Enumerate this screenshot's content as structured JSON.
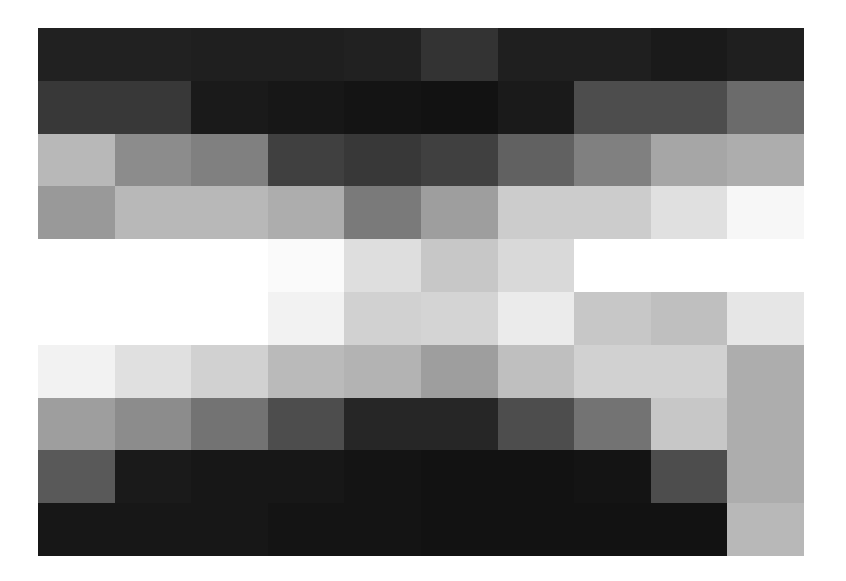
{
  "chart_data": {
    "type": "heatmap",
    "title": "",
    "xlabel": "",
    "ylabel": "",
    "colormap": "gray",
    "value_range": [
      0,
      1
    ],
    "rows": 10,
    "cols": 10,
    "values": [
      [
        0.13,
        0.13,
        0.12,
        0.12,
        0.13,
        0.2,
        0.12,
        0.12,
        0.1,
        0.12
      ],
      [
        0.22,
        0.22,
        0.1,
        0.09,
        0.08,
        0.07,
        0.1,
        0.3,
        0.3,
        0.42
      ],
      [
        0.72,
        0.55,
        0.5,
        0.25,
        0.22,
        0.25,
        0.38,
        0.5,
        0.65,
        0.68
      ],
      [
        0.6,
        0.72,
        0.72,
        0.68,
        0.48,
        0.62,
        0.8,
        0.8,
        0.88,
        0.97
      ],
      [
        1.0,
        1.0,
        1.0,
        0.98,
        0.87,
        0.78,
        0.85,
        1.0,
        1.0,
        1.0
      ],
      [
        1.0,
        1.0,
        1.0,
        0.95,
        0.82,
        0.83,
        0.92,
        0.78,
        0.75,
        0.9
      ],
      [
        0.95,
        0.88,
        0.82,
        0.73,
        0.7,
        0.62,
        0.75,
        0.82,
        0.82,
        0.68
      ],
      [
        0.62,
        0.55,
        0.45,
        0.3,
        0.15,
        0.15,
        0.3,
        0.45,
        0.78,
        0.68
      ],
      [
        0.35,
        0.1,
        0.09,
        0.09,
        0.08,
        0.07,
        0.07,
        0.08,
        0.3,
        0.68
      ],
      [
        0.09,
        0.09,
        0.09,
        0.08,
        0.08,
        0.07,
        0.07,
        0.07,
        0.07,
        0.72
      ]
    ]
  }
}
